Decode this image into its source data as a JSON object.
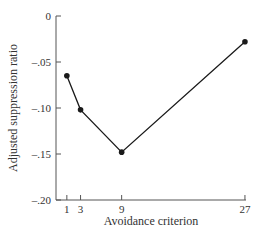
{
  "chart_data": {
    "type": "line",
    "title": "",
    "xlabel": "Avoidance criterion",
    "ylabel": "Adjusted suppression ratio",
    "x": [
      1,
      3,
      9,
      27
    ],
    "series": [
      {
        "name": "Adjusted suppression ratio",
        "values": [
          -0.065,
          -0.102,
          -0.148,
          -0.028
        ]
      }
    ],
    "xticks": [
      1,
      3,
      9,
      27
    ],
    "xtick_labels": [
      "1",
      "3",
      "9",
      "27"
    ],
    "yticks": [
      0,
      -0.05,
      -0.1,
      -0.15,
      -0.2
    ],
    "ytick_labels": [
      "0",
      "-.05",
      "-.10",
      "-.15",
      "-.20"
    ],
    "xlim": [
      0,
      27
    ],
    "ylim": [
      -0.2,
      0
    ],
    "grid": false,
    "legend": null,
    "colors": {
      "line": "#1a1a1a",
      "axis": "#555555",
      "text": "#333333"
    }
  }
}
